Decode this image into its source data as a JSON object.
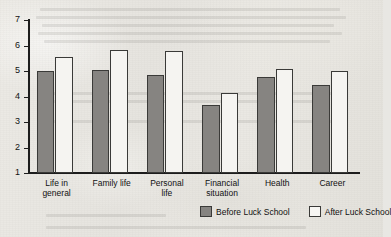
{
  "chart_data": {
    "type": "bar",
    "title": "",
    "subtitle": "",
    "xlabel": "",
    "ylabel": "",
    "ylim": [
      1,
      7
    ],
    "yticks": [
      "1",
      "2",
      "3",
      "4",
      "5",
      "6",
      "7"
    ],
    "grid": false,
    "legend_position": "bottom-right",
    "categories": [
      "Life in general",
      "Family life",
      "Personal life",
      "Financial situation",
      "Health",
      "Career"
    ],
    "category_lines": [
      [
        "Life in",
        "general"
      ],
      [
        "Family life",
        ""
      ],
      [
        "Personal",
        "life"
      ],
      [
        "Financial",
        "situation"
      ],
      [
        "Health",
        ""
      ],
      [
        "Career",
        ""
      ]
    ],
    "series": [
      {
        "name": "Before Luck School",
        "color": "#868481",
        "values": [
          5.0,
          5.05,
          4.85,
          3.67,
          4.77,
          4.47
        ]
      },
      {
        "name": "After Luck School",
        "color": "#f5f4f1",
        "values": [
          5.53,
          5.83,
          5.78,
          4.13,
          5.08,
          5.0
        ]
      }
    ]
  },
  "legend": {
    "items": [
      {
        "label": "Before Luck School",
        "swatch": "before"
      },
      {
        "label": "After Luck School",
        "swatch": "after"
      }
    ]
  }
}
